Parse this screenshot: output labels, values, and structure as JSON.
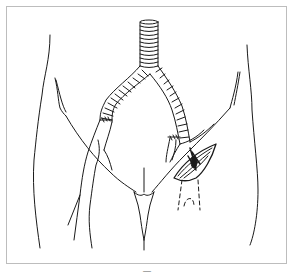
{
  "figure": {
    "caption": "—",
    "colors": {
      "stroke": "#1a1a1a",
      "frame": "#bdbdbd",
      "background": "#ffffff"
    },
    "elements": [
      "graft-trunk",
      "graft-left-limb",
      "graft-right-limb",
      "left-anastomosis-sutures",
      "right-anastomosis-sutures",
      "groin-incision",
      "dashed-tunnel-lines",
      "pelvis-outline",
      "leg-vessels"
    ]
  }
}
